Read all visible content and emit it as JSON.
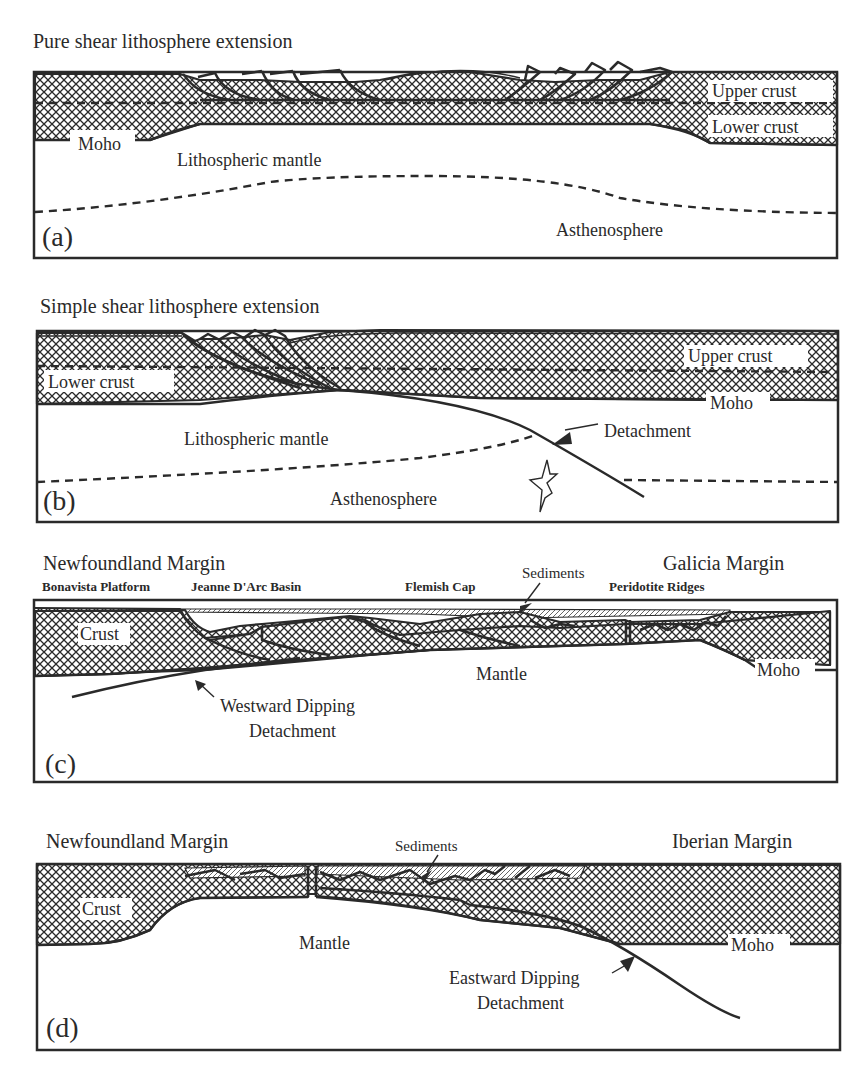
{
  "figure": {
    "panels": [
      {
        "id": "a",
        "panel_letter": "(a)",
        "title": "Pure shear lithosphere extension",
        "labels": {
          "upper_crust": "Upper crust",
          "lower_crust": "Lower crust",
          "moho": "Moho",
          "lithospheric_mantle": "Lithospheric mantle",
          "asthenosphere": "Asthenosphere"
        }
      },
      {
        "id": "b",
        "panel_letter": "(b)",
        "title": "Simple shear lithosphere extension",
        "labels": {
          "upper_crust": "Upper crust",
          "lower_crust": "Lower crust",
          "moho": "Moho",
          "lithospheric_mantle": "Lithospheric mantle",
          "detachment": "Detachment",
          "asthenosphere": "Asthenosphere"
        }
      },
      {
        "id": "c",
        "panel_letter": "(c)",
        "left_margin": "Newfoundland Margin",
        "right_margin": "Galicia Margin",
        "features": [
          "Bonavista Platform",
          "Jeanne D'Arc Basin",
          "Flemish Cap",
          "Peridotite Ridges"
        ],
        "labels": {
          "sediments": "Sediments",
          "crust": "Crust",
          "mantle": "Mantle",
          "moho": "Moho",
          "detachment_line1": "Westward Dipping",
          "detachment_line2": "Detachment"
        }
      },
      {
        "id": "d",
        "panel_letter": "(d)",
        "left_margin": "Newfoundland Margin",
        "right_margin": "Iberian Margin",
        "labels": {
          "sediments": "Sediments",
          "crust": "Crust",
          "mantle": "Mantle",
          "moho": "Moho",
          "detachment_line1": "Eastward Dipping",
          "detachment_line2": "Detachment"
        }
      }
    ],
    "colors": {
      "ink": "#2a2a2a",
      "background": "#ffffff"
    }
  }
}
